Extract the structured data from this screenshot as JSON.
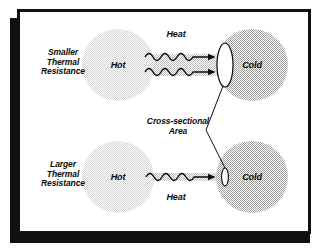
{
  "figure": {
    "background": "#ffffff",
    "frame_color": "#111111",
    "shadow_color": "#101010"
  },
  "colors": {
    "hot_fill": "#e3e3e3",
    "cold_fill": "#c9c9c9",
    "bar_fill": "#d7d7d7",
    "ink": "#0b0b0b",
    "ellipse_fill": "#ffffff"
  },
  "rows": [
    {
      "id": "smaller-resistance",
      "side_label": "Smaller\nThermal\nResistance",
      "hot_label": "Hot",
      "cold_label": "Cold",
      "heat_label": "Heat",
      "heat_label_position": "above",
      "wave_count": 2,
      "bar_thickness": "thick",
      "cross_section_size": "large"
    },
    {
      "id": "larger-resistance",
      "side_label": "Larger\nThermal\nResistance",
      "hot_label": "Hot",
      "cold_label": "Cold",
      "heat_label": "Heat",
      "heat_label_position": "below",
      "wave_count": 1,
      "bar_thickness": "thin",
      "cross_section_size": "small"
    }
  ],
  "annotation": {
    "label": "Cross-sectional\nArea",
    "leader_to": [
      "top-cross-section",
      "bottom-cross-section"
    ]
  }
}
